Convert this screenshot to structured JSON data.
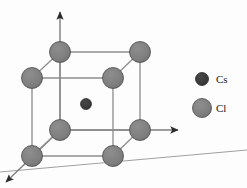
{
  "figure": {
    "background_color": "#fdfdfd",
    "width": 247,
    "height": 188
  },
  "colors": {
    "cs_atom": "#3a3a3a",
    "cl_atom": "#808080",
    "atom_outline": "#4a4a4a",
    "bond_line": "#9a9a9a",
    "cell_edge": "#8d8d8d",
    "axis_line": "#7d7d7d",
    "axis_arrow": "#2b2b2b",
    "ground_line": "#a0a0a0",
    "label_text": "#1a1a1a"
  },
  "axes": [
    {
      "name": "vertical-axis",
      "direction": "up",
      "x1": 60,
      "y1": 130,
      "x2": 60,
      "y2": 12,
      "arrow": true
    },
    {
      "name": "horizontal-axis",
      "direction": "right",
      "x1": 60,
      "y1": 130,
      "x2": 178,
      "y2": 130,
      "arrow": true
    },
    {
      "name": "diagonal-axis",
      "direction": "down-left",
      "x1": 60,
      "y1": 130,
      "x2": 6,
      "y2": 182,
      "arrow": true
    }
  ],
  "ground_line": {
    "name": "ground-plane-line",
    "x1": 0,
    "y1": 172,
    "x2": 247,
    "y2": 150
  },
  "unit_cell": {
    "name": "cubic-unit-cell",
    "vertices": [
      {
        "id": "back-top-left",
        "x": 60,
        "y": 52,
        "species": "Cl"
      },
      {
        "id": "back-top-right",
        "x": 140,
        "y": 52,
        "species": "Cl"
      },
      {
        "id": "front-top-left",
        "x": 32,
        "y": 78,
        "species": "Cl"
      },
      {
        "id": "front-top-right",
        "x": 113,
        "y": 78,
        "species": "Cl"
      },
      {
        "id": "back-bottom-left",
        "x": 60,
        "y": 130,
        "species": "Cl"
      },
      {
        "id": "back-bottom-right",
        "x": 140,
        "y": 130,
        "species": "Cl"
      },
      {
        "id": "front-bottom-left",
        "x": 32,
        "y": 156,
        "species": "Cl"
      },
      {
        "id": "front-bottom-right",
        "x": 113,
        "y": 156,
        "species": "Cl"
      }
    ],
    "edges": [
      [
        "back-top-left",
        "back-top-right"
      ],
      [
        "front-top-left",
        "front-top-right"
      ],
      [
        "back-top-left",
        "front-top-left"
      ],
      [
        "back-top-right",
        "front-top-right"
      ],
      [
        "back-bottom-left",
        "back-bottom-right"
      ],
      [
        "front-bottom-left",
        "front-bottom-right"
      ],
      [
        "back-bottom-left",
        "front-bottom-left"
      ],
      [
        "back-bottom-right",
        "front-bottom-right"
      ],
      [
        "back-top-left",
        "back-bottom-left"
      ],
      [
        "back-top-right",
        "back-bottom-right"
      ],
      [
        "front-top-left",
        "front-bottom-left"
      ],
      [
        "front-top-right",
        "front-bottom-right"
      ]
    ],
    "center_atom": {
      "id": "center",
      "x": 86,
      "y": 104,
      "species": "Cs"
    }
  },
  "atom_radii": {
    "Cl": 10.5,
    "Cs": 5.5
  },
  "legend": {
    "name": "species-legend",
    "items": [
      {
        "label": "Cs",
        "species": "Cs",
        "marker_x": 202,
        "marker_y": 79,
        "radius": 6.5,
        "color": "#3a3a3a",
        "text_x": 216,
        "text_y": 83
      },
      {
        "label": "Cl",
        "species": "Cl",
        "marker_x": 202,
        "marker_y": 108,
        "radius": 9.5,
        "color": "#808080",
        "text_x": 216,
        "text_y": 112
      }
    ]
  }
}
